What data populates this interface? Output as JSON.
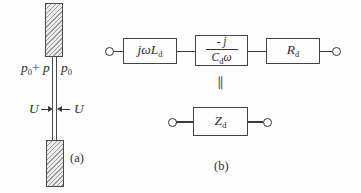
{
  "panel_a": {
    "caption": "(a)",
    "pressure_left": {
      "base": "p",
      "sub": "0",
      "plus": "+",
      "term": " p"
    },
    "pressure_right": {
      "base": "p",
      "sub": "0"
    },
    "velocity_left_label": "U",
    "velocity_right_label": "U"
  },
  "panel_b": {
    "caption": "(b)",
    "equivalence_symbol": "∥",
    "elements": {
      "inductance": {
        "expr": "jωL",
        "sub": "d"
      },
      "capacitance": {
        "numerator": "- j",
        "den_base": "C",
        "den_sub": "d",
        "den_suffix": "ω"
      },
      "resistance": {
        "expr": "R",
        "sub": "d"
      },
      "impedance": {
        "expr": "Z",
        "sub": "d"
      }
    }
  },
  "colors": {
    "ink": "#333333",
    "hatch_bg": "#ececec",
    "hatch_line": "#9a9a9a"
  }
}
